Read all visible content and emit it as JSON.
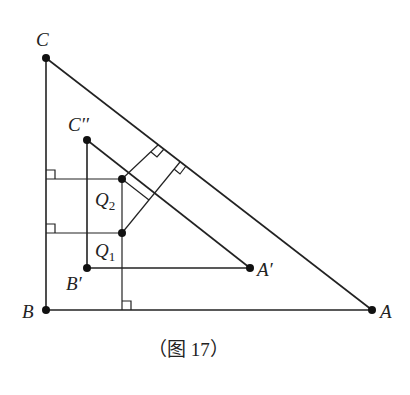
{
  "figure": {
    "caption": "（图 17）",
    "points": {
      "C": {
        "label": "C",
        "x": 46,
        "y": 58
      },
      "B": {
        "label": "B",
        "x": 46,
        "y": 310
      },
      "A": {
        "label": "A",
        "x": 372,
        "y": 310
      },
      "C2": {
        "label": "C′′",
        "x": 87,
        "y": 140
      },
      "B1": {
        "label": "B′",
        "x": 87,
        "y": 268
      },
      "A1": {
        "label": "A′",
        "x": 250,
        "y": 268
      },
      "Q2": {
        "label": "Q",
        "sub": "2",
        "x": 122,
        "y": 179
      },
      "Q1": {
        "label": "Q",
        "sub": "1",
        "x": 122,
        "y": 233
      }
    },
    "triangles": [
      "ABC",
      "A′B′C′′"
    ],
    "right_angle_markers": 5
  }
}
